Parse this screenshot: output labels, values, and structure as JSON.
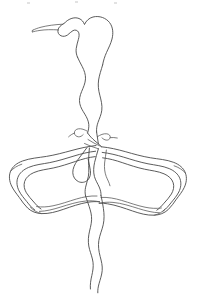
{
  "image": {
    "title": "Line drawing of a rooted plant specimen",
    "medium": "pen-and-ink line drawing",
    "background_color": "#ffffff",
    "stroke_color": "#4a4a4a",
    "width_px": 197,
    "height_px": 300,
    "alt_text": "Black ink contour drawing on white background showing a bulbous head at top with a thin tapered tip pointing left, a long sinuous double-line stem descending to a central junction, two large elongated lobes spreading left and right from the junction, and a tapering stem descending to the bottom edge."
  },
  "parts": [
    {
      "id": "apex-bulb",
      "label": "Bulbous apex",
      "description": "Rounded swollen head at the top of the stem"
    },
    {
      "id": "apex-tip",
      "label": "Tapered tip",
      "description": "Thin pointed extension projecting to the left from the apex"
    },
    {
      "id": "upper-stem",
      "label": "Upper sinuous stem",
      "description": "Long wavy double-contour stalk descending from the apex to the junction"
    },
    {
      "id": "junction",
      "label": "Central junction",
      "description": "Node where the lateral lobes branch from the stem"
    },
    {
      "id": "left-hook",
      "label": "Left hook",
      "description": "Small curled filament on the left of the stem above the junction"
    },
    {
      "id": "right-hook",
      "label": "Right hook",
      "description": "Small curled filament on the right of the stem above the junction"
    },
    {
      "id": "left-lobe",
      "label": "Left lobe",
      "description": "Large elongated nested-outline lobe extending left from the junction"
    },
    {
      "id": "right-lobe",
      "label": "Right lobe",
      "description": "Large elongated nested-outline lobe extending right from the junction"
    },
    {
      "id": "teardrop",
      "label": "Teardrop loop",
      "description": "Small pendant teardrop-shaped loop hanging below the junction on the left"
    },
    {
      "id": "lower-stem",
      "label": "Lower stem",
      "description": "Tapering double-line stem descending from the junction to the bottom edge"
    }
  ]
}
